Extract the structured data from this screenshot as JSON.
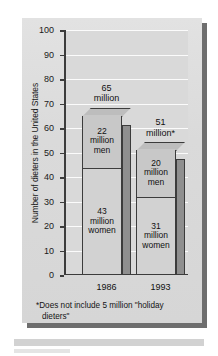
{
  "chart_data": {
    "type": "bar",
    "subtype": "stacked-bar-3d",
    "title": "",
    "xlabel": "",
    "ylabel": "Number of dieters in the United States",
    "ylim": [
      0,
      100
    ],
    "ytick_step": 10,
    "yticks": [
      "100",
      "90",
      "80",
      "70",
      "60",
      "50",
      "40",
      "30",
      "20",
      "10",
      "0"
    ],
    "categories": [
      "1986",
      "1993"
    ],
    "grid": "horizontal",
    "legend": "none",
    "series": [
      {
        "name": "women",
        "values": [
          43,
          31
        ]
      },
      {
        "name": "men",
        "values": [
          22,
          20
        ]
      }
    ],
    "totals": [
      65,
      51
    ],
    "bars": [
      {
        "category": "1986",
        "total": 65,
        "total_label_line1": "65",
        "total_label_line2": "million",
        "top_segment": {
          "value": 22,
          "label_line1": "22",
          "label_line2": "million",
          "label_line3": "men"
        },
        "bottom_segment": {
          "value": 43,
          "label_line1": "43",
          "label_line2": "million",
          "label_line3": "women"
        }
      },
      {
        "category": "1993",
        "total": 51,
        "total_label_line1": "51",
        "total_label_line2": "million*",
        "top_segment": {
          "value": 20,
          "label_line1": "20",
          "label_line2": "million",
          "label_line3": "men"
        },
        "bottom_segment": {
          "value": 31,
          "label_line1": "31",
          "label_line2": "million",
          "label_line3": "women"
        }
      }
    ],
    "footnote_line1": "*Does not include 5 million \"holiday",
    "footnote_line2": "dieters\"",
    "colors": {
      "panel": "#d9d9d9",
      "card": "#dcdcdc",
      "gridline": "#fbfbfb",
      "axis": "#3c3c3c",
      "bar_top_segment": "#c8c8c8",
      "bar_bottom_segment": "#d2d2d2",
      "bar_side_3d": "#8f8f8f",
      "shadow": "#6e6e6e",
      "text": "#101010"
    }
  }
}
